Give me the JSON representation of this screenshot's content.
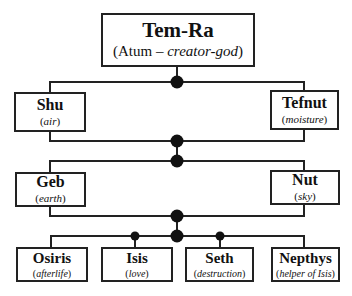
{
  "diagram": {
    "type": "family-tree",
    "colors": {
      "line": "#222222",
      "node": "#111111",
      "background": "#ffffff"
    },
    "root": {
      "name": "Tem-Ra",
      "role_prefix": "(Atum – ",
      "role_italic": "creator-god",
      "role_suffix": ")"
    },
    "generation1": [
      {
        "name": "Shu",
        "role": "air"
      },
      {
        "name": "Tefnut",
        "role": "moisture"
      }
    ],
    "generation2": [
      {
        "name": "Geb",
        "role": "earth"
      },
      {
        "name": "Nut",
        "role": "sky"
      }
    ],
    "generation3": [
      {
        "name": "Osiris",
        "role": "afterlife"
      },
      {
        "name": "Isis",
        "role": "love"
      },
      {
        "name": "Seth",
        "role": "destruction"
      },
      {
        "name": "Nepthys",
        "role": "helper of Isis"
      }
    ],
    "edges": [
      {
        "from": "Tem-Ra",
        "to": "Shu"
      },
      {
        "from": "Tem-Ra",
        "to": "Tefnut"
      },
      {
        "from": "Shu+Tefnut",
        "to": "Geb"
      },
      {
        "from": "Shu+Tefnut",
        "to": "Nut"
      },
      {
        "from": "Geb+Nut",
        "to": "Osiris"
      },
      {
        "from": "Geb+Nut",
        "to": "Isis"
      },
      {
        "from": "Geb+Nut",
        "to": "Seth"
      },
      {
        "from": "Geb+Nut",
        "to": "Nepthys"
      }
    ]
  }
}
